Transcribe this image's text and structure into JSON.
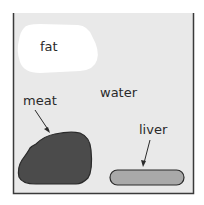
{
  "diagram": {
    "container": {
      "name": "beaker",
      "fill": "#e8e8e8",
      "border": "#3a3a3a"
    },
    "labels": {
      "fat": "fat",
      "water": "water",
      "meat": "meat",
      "liver": "liver"
    },
    "colors": {
      "fat": "#ffffff",
      "meat": "#4a4a4a",
      "liver": "#a8a8a8",
      "outline": "#2a2a2a"
    }
  }
}
